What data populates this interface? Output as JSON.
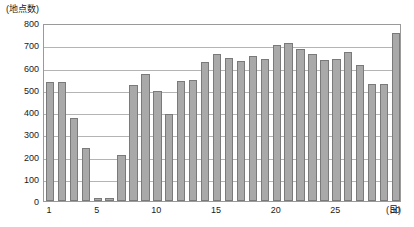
{
  "chart_data": {
    "type": "bar",
    "title": "",
    "subtitle": "",
    "ylabel": "(地点数)",
    "xlabel": "(日)",
    "ylim": [
      0,
      800
    ],
    "y_ticks": [
      0,
      100,
      200,
      300,
      400,
      500,
      600,
      700,
      800
    ],
    "grid": true,
    "legend": null,
    "x_tick_labels": [
      "1",
      "5",
      "10",
      "15",
      "20",
      "25",
      "30"
    ],
    "x_tick_days": [
      1,
      5,
      10,
      15,
      20,
      25,
      30
    ],
    "categories": [
      1,
      2,
      3,
      4,
      5,
      6,
      7,
      8,
      9,
      10,
      11,
      12,
      13,
      14,
      15,
      16,
      17,
      18,
      19,
      20,
      21,
      22,
      23,
      24,
      25,
      26,
      27,
      28,
      29,
      30
    ],
    "values": [
      535,
      535,
      375,
      240,
      12,
      15,
      205,
      520,
      570,
      495,
      390,
      540,
      545,
      625,
      660,
      645,
      630,
      650,
      640,
      700,
      710,
      685,
      660,
      635,
      640,
      670,
      610,
      525,
      525,
      680
    ],
    "values_last": 755,
    "bar_color": "#a9a9a9",
    "bar_edge_color": "#7a7a7a",
    "grid_color": "#b4b4b4",
    "frame_color": "#9a9a9a"
  },
  "axis": {
    "y_unit_caption": "(地点数)",
    "x_unit_caption": "(日)"
  }
}
